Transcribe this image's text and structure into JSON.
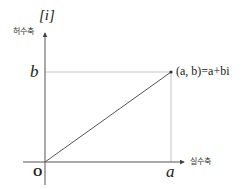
{
  "diagram": {
    "axes": {
      "imaginary_axis_symbol": "[i]",
      "imaginary_axis_label": "허수축",
      "real_axis_label": "실수축",
      "origin_label": "O"
    },
    "tick_labels": {
      "y_value": "b",
      "x_value": "a"
    },
    "point": {
      "label": "(a, b)=a+bi",
      "x_symbol": "a",
      "y_symbol": "b"
    },
    "colors": {
      "axis": "#555555",
      "guide": "#aaaaaa",
      "segment": "#555555",
      "text": "#222222",
      "background": "#ffffff"
    }
  }
}
